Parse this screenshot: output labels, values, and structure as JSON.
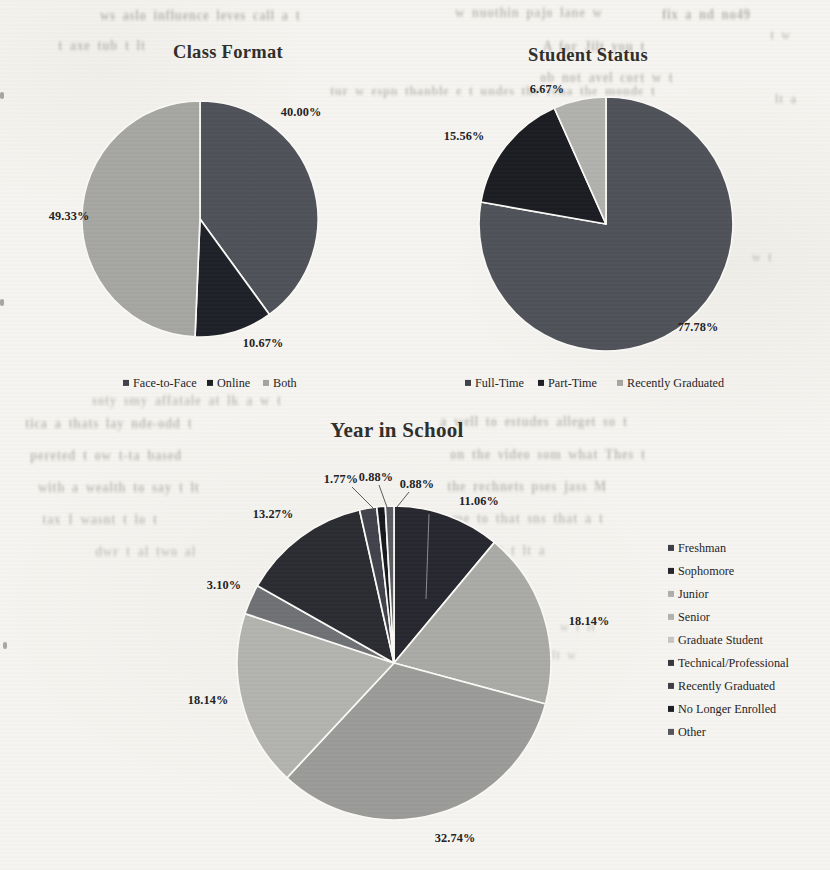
{
  "page": {
    "background": "#f5f4f0",
    "separator_color": "#faf9f5"
  },
  "chart_data": [
    {
      "id": "class-format",
      "type": "pie",
      "title": "Class Format",
      "cx": 200,
      "cy": 219,
      "r": 118,
      "legend_position": "bottom",
      "slices": [
        {
          "label": "Face-to-Face",
          "value": 40.0,
          "display": "40.00%",
          "color": "#4e5158",
          "legend_color": "#3f4148",
          "label_pos": [
            301,
            112
          ]
        },
        {
          "label": "Online",
          "value": 10.67,
          "display": "10.67%",
          "color": "#1e2027",
          "legend_color": "#1c1e24",
          "label_pos": [
            263,
            343
          ]
        },
        {
          "label": "Both",
          "value": 49.33,
          "display": "49.33%",
          "color": "#a5a5a2",
          "legend_color": "#a2a29f",
          "label_pos": [
            69,
            216
          ]
        }
      ],
      "legend": {
        "layout": "horizontal",
        "y": 383,
        "items_x": [
          123,
          207,
          263
        ]
      },
      "leaders": []
    },
    {
      "id": "student-status",
      "type": "pie",
      "title": "Student Status",
      "cx": 606,
      "cy": 224,
      "r": 127,
      "legend_position": "bottom",
      "slices": [
        {
          "label": "Full-Time",
          "value": 77.78,
          "display": "77.78%",
          "color": "#4e5158",
          "legend_color": "#3f4148",
          "label_pos": [
            698,
            327
          ]
        },
        {
          "label": "Part-Time",
          "value": 15.56,
          "display": "15.56%",
          "color": "#1a1c22",
          "legend_color": "#1c1e24",
          "label_pos": [
            464,
            136
          ]
        },
        {
          "label": "Recently Graduated",
          "value": 6.67,
          "display": "6.67%",
          "color": "#b0b0ad",
          "legend_color": "#a6a6a3",
          "label_pos": [
            547,
            89
          ]
        }
      ],
      "legend": {
        "layout": "horizontal",
        "y": 383,
        "items_x": [
          465,
          538,
          617
        ]
      },
      "leaders": []
    },
    {
      "id": "year-in-school",
      "type": "pie",
      "title": "Year in School",
      "cx": 394,
      "cy": 663,
      "r": 157,
      "legend_position": "right",
      "slices": [
        {
          "label": "Freshman",
          "value": 11.06,
          "display": "11.06%",
          "color": "#26272e",
          "legend_color": "#3c3e45",
          "label_pos": [
            479,
            501
          ]
        },
        {
          "label": "Sophomore",
          "value": 18.14,
          "display": "18.14%",
          "color": "#a9a9a6",
          "legend_color": "#25262c",
          "label_pos": [
            589,
            621
          ]
        },
        {
          "label": "Junior",
          "value": 32.74,
          "display": "32.74%",
          "color": "#9a9a98",
          "legend_color": "#aeaeac",
          "label_pos": [
            455,
            838
          ]
        },
        {
          "label": "Senior",
          "value": 18.14,
          "display": "18.14%",
          "color": "#b2b2af",
          "legend_color": "#b1b1af",
          "label_pos": [
            208,
            700
          ]
        },
        {
          "label": "Graduate Student",
          "value": 3.1,
          "display": "3.10%",
          "color": "#6f7074",
          "legend_color": "#c6c6c4",
          "label_pos": [
            224,
            585
          ]
        },
        {
          "label": "Technical/Professional",
          "value": 13.27,
          "display": "13.27%",
          "color": "#2a2b31",
          "legend_color": "#35363c",
          "label_pos": [
            273,
            514
          ]
        },
        {
          "label": "Recently Graduated",
          "value": 1.77,
          "display": "1.77%",
          "color": "#40414a",
          "legend_color": "#3d3e44",
          "label_pos": [
            341,
            479
          ]
        },
        {
          "label": "No Longer Enrolled",
          "value": 0.88,
          "display": "0.88%",
          "color": "#17181e",
          "legend_color": "#1b1c21",
          "label_pos": [
            376,
            477
          ]
        },
        {
          "label": "Other",
          "value": 0.88,
          "display": "0.88%",
          "color": "#5a5b62",
          "legend_color": "#54555b",
          "label_pos": [
            417,
            484
          ]
        }
      ],
      "legend": {
        "layout": "vertical",
        "x": 668,
        "y_start": 548,
        "step": 23
      },
      "leaders": [
        {
          "x1": 352,
          "y1": 487,
          "x2": 376,
          "y2": 511,
          "color": "#5a5a58",
          "w": 1
        },
        {
          "x1": 379,
          "y1": 485,
          "x2": 388,
          "y2": 510,
          "color": "#5a5a58",
          "w": 1
        },
        {
          "x1": 409,
          "y1": 492,
          "x2": 397,
          "y2": 507,
          "color": "#5a5a58",
          "w": 1
        },
        {
          "x1": 429,
          "y1": 514,
          "x2": 426,
          "y2": 599,
          "color": "#8a8a8e",
          "w": 1
        }
      ]
    }
  ],
  "bleedthrough": [
    {
      "x": 100,
      "y": 8,
      "s": 13,
      "t": "ws aslo influence leves call a t",
      "o": 0.55
    },
    {
      "x": 455,
      "y": 5,
      "s": 13,
      "t": "w nuothin pajo lane w",
      "o": 0.5
    },
    {
      "x": 662,
      "y": 7,
      "s": 13,
      "t": "fix a nd no49",
      "o": 0.6
    },
    {
      "x": 58,
      "y": 38,
      "s": 13,
      "t": "t axe tub t lt",
      "o": 0.5
    },
    {
      "x": 543,
      "y": 39,
      "s": 13,
      "t": "A for Jilt you t",
      "o": 0.55
    },
    {
      "x": 540,
      "y": 70,
      "s": 13,
      "t": "ob not avel cort w t",
      "o": 0.5
    },
    {
      "x": 330,
      "y": 84,
      "s": 12.5,
      "t": "tur w espn  thanble e t undes the   reha   the monde t",
      "o": 0.5
    },
    {
      "x": 770,
      "y": 28,
      "s": 12,
      "t": "t w",
      "o": 0.45
    },
    {
      "x": 775,
      "y": 92,
      "s": 12,
      "t": "lt a",
      "o": 0.45
    },
    {
      "x": 752,
      "y": 250,
      "s": 12,
      "t": "w t",
      "o": 0.4
    },
    {
      "x": 92,
      "y": 393,
      "s": 13,
      "t": "soty smy affatale at lk a w t",
      "o": 0.45
    },
    {
      "x": 25,
      "y": 416,
      "s": 13,
      "t": "tica a thats  lay nde-odd t",
      "o": 0.5
    },
    {
      "x": 440,
      "y": 414,
      "s": 13,
      "t": "a well to estudes alleget so t",
      "o": 0.5
    },
    {
      "x": 30,
      "y": 448,
      "s": 13,
      "t": "pereted t   ow t-ta based",
      "o": 0.5
    },
    {
      "x": 450,
      "y": 447,
      "s": 13,
      "t": "on the video  som  what Thes t",
      "o": 0.5
    },
    {
      "x": 38,
      "y": 480,
      "s": 13,
      "t": "with a wealth to  say  t lt",
      "o": 0.5
    },
    {
      "x": 447,
      "y": 479,
      "s": 13,
      "t": "the rechnets   pses jass  M",
      "o": 0.5
    },
    {
      "x": 42,
      "y": 512,
      "s": 13,
      "t": "tax I wasnt t lo t",
      "o": 0.45
    },
    {
      "x": 452,
      "y": 511,
      "s": 13,
      "t": "me to  that  sns that a t",
      "o": 0.45
    },
    {
      "x": 95,
      "y": 544,
      "s": 13,
      "t": "dwr t al two al",
      "o": 0.4
    },
    {
      "x": 468,
      "y": 543,
      "s": 13,
      "t": "pe wt  t lt a",
      "o": 0.4
    },
    {
      "x": 560,
      "y": 620,
      "s": 12,
      "t": "w  t lt",
      "o": 0.35
    },
    {
      "x": 552,
      "y": 648,
      "s": 12,
      "t": "lt w",
      "o": 0.35
    }
  ],
  "specks": [
    {
      "x": 0,
      "y": 92
    },
    {
      "x": 0,
      "y": 299
    },
    {
      "x": 3,
      "y": 642
    }
  ]
}
